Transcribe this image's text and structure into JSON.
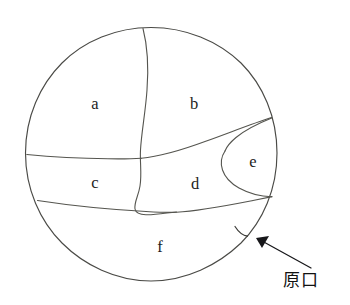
{
  "figure": {
    "background_color": "#ffffff",
    "line_color": "#4a4a46",
    "label_color": "#1d1d1d",
    "callout_color": "#17171a"
  },
  "circle": {
    "name": "outer-circle",
    "center_x": 151,
    "center_y": 154,
    "radius": 127
  },
  "regions": [
    {
      "id": "a",
      "label": "a",
      "x": 95,
      "y": 105
    },
    {
      "id": "b",
      "label": "b",
      "x": 194,
      "y": 105
    },
    {
      "id": "c",
      "label": "c",
      "x": 95,
      "y": 184
    },
    {
      "id": "d",
      "label": "d",
      "x": 195,
      "y": 185
    },
    {
      "id": "e",
      "label": "e",
      "x": 253,
      "y": 163
    },
    {
      "id": "f",
      "label": "f",
      "x": 160,
      "y": 248
    }
  ],
  "callout": {
    "label": "原口",
    "label_x": 283,
    "label_y": 281,
    "arrow_tip_x": 256,
    "arrow_tip_y": 238,
    "arrow_tail_x": 311,
    "arrow_tail_y": 268
  },
  "icons": {
    "arrow": "arrow-pointer-icon",
    "hook": "blastopore-notch-icon"
  }
}
